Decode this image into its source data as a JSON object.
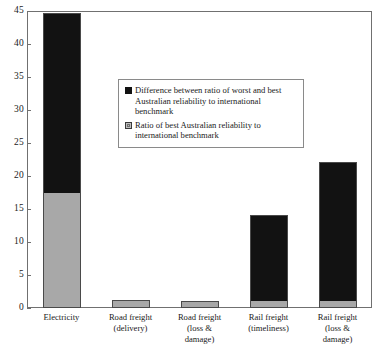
{
  "chart_data": {
    "type": "bar",
    "stacked": true,
    "title": "",
    "xlabel": "",
    "ylabel": "",
    "ylim": [
      0,
      45
    ],
    "yticks": [
      "0",
      "5",
      "10",
      "15",
      "20",
      "25",
      "30",
      "35",
      "40",
      "45"
    ],
    "grid": false,
    "legend_position": "inside-top-center",
    "categories": [
      "Electricity",
      "Road freight (delivery)",
      "Road freight (loss & damage)",
      "Rail freight (timeliness)",
      "Rail freight (loss & damage)"
    ],
    "category_label_lines": [
      [
        "Electricity"
      ],
      [
        "Road freight",
        "(delivery)"
      ],
      [
        "Road freight",
        "(loss &",
        "damage)"
      ],
      [
        "Rail freight",
        "(timeliness)"
      ],
      [
        "Rail freight",
        "(loss &",
        "damage)"
      ]
    ],
    "series": [
      {
        "name": "Ratio of best Australian reliability to international benchmark",
        "key": "gray",
        "color": "#a8a8a8",
        "values": [
          17.5,
          1.2,
          1.0,
          1.0,
          1.0
        ]
      },
      {
        "name": "Difference between ratio of worst and best Australian reliability to international benchmark",
        "key": "black",
        "color": "#121212",
        "values": [
          27.2,
          0,
          0,
          13.1,
          21.1
        ]
      }
    ],
    "totals": [
      44.7,
      1.2,
      1.0,
      14.1,
      22.1
    ]
  },
  "legend": {
    "items": [
      {
        "swatch": "black",
        "lines": [
          "Difference between ratio of worst and best",
          "Australian reliability to international",
          "benchmark"
        ]
      },
      {
        "swatch": "gray",
        "lines": [
          "Ratio of best Australian reliability to",
          "international benchmark"
        ]
      }
    ]
  },
  "colors": {
    "series_black": "#121212",
    "series_gray": "#a8a8a8",
    "axis": "#707070",
    "text": "#1a1a1a"
  }
}
